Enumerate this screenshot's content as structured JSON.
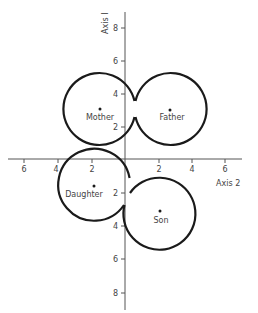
{
  "diagram": {
    "type": "overlapping-circle-plot",
    "axes": {
      "horizontal": {
        "label": "Axis 2",
        "ticks_left": [
          "6",
          "4",
          "2"
        ],
        "ticks_right": [
          "2",
          "4",
          "6"
        ]
      },
      "vertical": {
        "label": "Axis I",
        "ticks_up": [
          "8",
          "6",
          "4",
          "2"
        ],
        "ticks_down": [
          "2",
          "4",
          "6",
          "8"
        ]
      }
    },
    "nodes": [
      {
        "label": "Mother",
        "x": -1.5,
        "y": 3
      },
      {
        "label": "Father",
        "x": 2.7,
        "y": 3
      },
      {
        "label": "Daughter",
        "x": -1.9,
        "y": -1.5
      },
      {
        "label": "Son",
        "x": 2.1,
        "y": -3.1
      }
    ],
    "colors": {
      "line": "#1a1a1a",
      "axis": "#555555",
      "text": "#444444",
      "background": "#ffffff"
    }
  }
}
